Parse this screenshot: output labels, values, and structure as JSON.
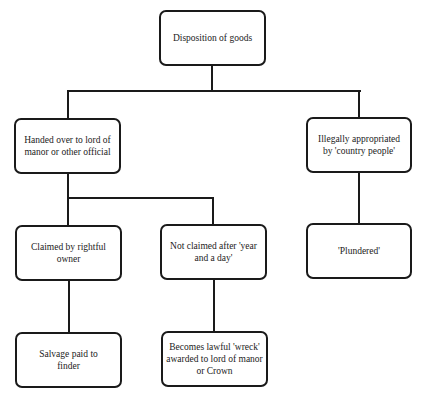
{
  "diagram": {
    "type": "flowchart",
    "nodes": {
      "root": "Disposition of goods",
      "handed_over": "Handed over to lord of manor or other official",
      "illegally": "Illegally appropriated by 'country people'",
      "claimed": "Claimed by rightful owner",
      "not_claimed": "Not claimed after 'year and a day'",
      "plundered": "'Plundered'",
      "salvage": "Salvage paid to finder",
      "wreck": "Becomes lawful 'wreck' awarded to lord of manor or Crown"
    },
    "edges": [
      [
        "root",
        "handed_over"
      ],
      [
        "root",
        "illegally"
      ],
      [
        "handed_over",
        "claimed"
      ],
      [
        "handed_over",
        "not_claimed"
      ],
      [
        "illegally",
        "plundered"
      ],
      [
        "claimed",
        "salvage"
      ],
      [
        "not_claimed",
        "wreck"
      ]
    ]
  }
}
